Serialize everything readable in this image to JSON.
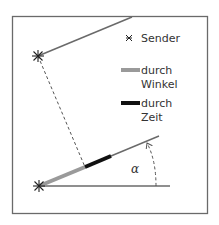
{
  "legend": {
    "sender_label": "Sender",
    "angle_label_line1": "durch",
    "angle_label_line2": "Winkel",
    "time_label_line1": "durch",
    "time_label_line2": "Zeit"
  },
  "angle_label": "α",
  "colors": {
    "frame": "#6a6a6a",
    "lines": "#6a6a6a",
    "angle_segment": "#9a9a9a",
    "time_segment": "#111111",
    "dashed": "#555555",
    "text": "#333333"
  }
}
